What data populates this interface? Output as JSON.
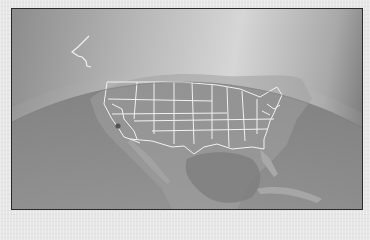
{
  "image": {
    "description": "Grayscale view of Earth from space showing North America with US state boundaries outlined in white",
    "colors": {
      "space_light": "#d6d6d6",
      "space_dark": "#6d6d6d",
      "atmosphere_glow": "#e8e8e8",
      "land": "#9a9a9a",
      "ocean": "#8d8d8d",
      "gulf": "#7f7f7f",
      "borders": "#f2f2f2",
      "marker": "#555555",
      "frame_border": "#2b2b2b"
    },
    "marker": {
      "label": "location-dot",
      "approx_position": [
        117,
        125
      ]
    }
  }
}
